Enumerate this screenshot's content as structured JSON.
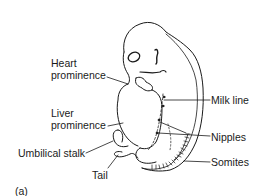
{
  "figure": {
    "panel_label": "(a)",
    "line_color": "#1a1a1a",
    "background": "#ffffff"
  },
  "labels": {
    "heart_prominence": {
      "line1": "Heart",
      "line2": "prominence"
    },
    "liver_prominence": {
      "line1": "Liver",
      "line2": "prominence"
    },
    "umbilical_stalk": "Umbilical stalk",
    "tail": "Tail",
    "milk_line": "Milk line",
    "nipples": "Nipples",
    "somites": "Somites"
  }
}
